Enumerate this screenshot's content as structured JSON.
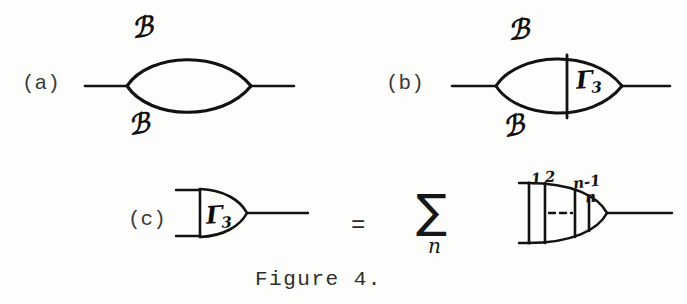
{
  "figure": {
    "caption": "Figure 4.",
    "panels": [
      {
        "id": "a",
        "label": "(a)",
        "description": "self-energy bubble with two propagator lines",
        "labels": {
          "upper_propagator": "ℬ",
          "lower_propagator": "ℬ"
        }
      },
      {
        "id": "b",
        "label": "(b)",
        "description": "self-energy bubble with vertex correction insertion",
        "labels": {
          "upper_propagator": "ℬ",
          "lower_propagator": "ℬ",
          "vertex": "Γ",
          "vertex_subscript": "3"
        }
      },
      {
        "id": "c",
        "label": "(c)",
        "description": "three-point vertex function expansion",
        "lhs": {
          "vertex": "Γ",
          "vertex_subscript": "3"
        },
        "equals": "=",
        "sum": {
          "symbol": "∑",
          "index": "n"
        },
        "rhs": {
          "description": "ladder diagram with n rungs",
          "rung_labels": [
            "1",
            "2",
            "n-1",
            "n"
          ],
          "ellipsis": "---"
        }
      }
    ]
  },
  "colors": {
    "ink": "#111111",
    "typewriter": "#3a3a3a",
    "background": "#fdfdfc"
  }
}
